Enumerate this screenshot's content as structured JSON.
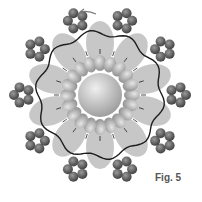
{
  "figure": {
    "label": "Fig. 5",
    "colors": {
      "background": "#ffffff",
      "core": "#c8c8c8",
      "lobe": "#b4b4b4",
      "outer_atom": "#5a5a5a",
      "outline": "#1e1e1e",
      "arrow": "#7a7a7a"
    },
    "center": [
      100,
      95
    ],
    "core_radius": 22,
    "inner_ring": {
      "count": 20,
      "radius": 32,
      "size": 6
    },
    "lobe_ring": {
      "count": 10,
      "radius": 52
    },
    "outer_clusters": {
      "count": 10,
      "radius": 78
    },
    "outline": {
      "radius": 62,
      "waves": 10,
      "amplitude": 3
    }
  }
}
